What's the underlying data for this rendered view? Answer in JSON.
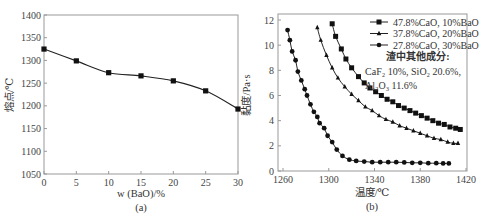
{
  "chart_data": [
    {
      "id": "a",
      "type": "line",
      "title": "",
      "caption": "(a)",
      "xlabel": "w (BaO)/%",
      "ylabel": "熔点/℃",
      "xlim": [
        0,
        30
      ],
      "ylim": [
        1050,
        1400
      ],
      "xticks": [
        0,
        5,
        10,
        15,
        20,
        25,
        30
      ],
      "yticks": [
        1050,
        1100,
        1150,
        1200,
        1250,
        1300,
        1350,
        1400
      ],
      "grid": false,
      "series": [
        {
          "name": "melting point",
          "marker": "square",
          "x": [
            0,
            5,
            10,
            15,
            20,
            25,
            30
          ],
          "values": [
            1325,
            1299,
            1273,
            1266,
            1255,
            1233,
            1193
          ]
        }
      ]
    },
    {
      "id": "b",
      "type": "line",
      "title": "",
      "caption": "(b)",
      "xlabel": "温度/℃",
      "ylabel": "黏度/Pa·s",
      "xlim": [
        1255,
        1420
      ],
      "ylim": [
        0,
        12.5
      ],
      "xticks": [
        1260,
        1300,
        1340,
        1380,
        1420
      ],
      "yticks": [
        0,
        2,
        4,
        6,
        8,
        10,
        12
      ],
      "grid": false,
      "legend_position": "upper right",
      "annotation": {
        "title": "渣中其他成分:",
        "line1": "CaF₂ 10%, SiO₂ 20.6%,",
        "line2": "Al₂O₃ 11.6%"
      },
      "series": [
        {
          "name": "47.8%CaO, 10%BaO",
          "marker": "square",
          "x": [
            1303,
            1306,
            1311,
            1315,
            1320,
            1326,
            1331,
            1336,
            1341,
            1346,
            1351,
            1356,
            1361,
            1366,
            1371,
            1376,
            1381,
            1386,
            1391,
            1396,
            1401,
            1406,
            1411,
            1415
          ],
          "values": [
            11.7,
            10.7,
            9.7,
            8.9,
            8.2,
            7.5,
            7.0,
            6.6,
            6.3,
            6.0,
            5.7,
            5.5,
            5.2,
            5.0,
            4.8,
            4.6,
            4.4,
            4.2,
            4.0,
            3.8,
            3.7,
            3.5,
            3.4,
            3.3
          ]
        },
        {
          "name": "37.8%CaO, 20%BaO",
          "marker": "triangle",
          "x": [
            1290,
            1293,
            1298,
            1303,
            1308,
            1314,
            1320,
            1326,
            1332,
            1338,
            1344,
            1350,
            1356,
            1362,
            1368,
            1374,
            1380,
            1386,
            1392,
            1398,
            1404,
            1409,
            1413
          ],
          "values": [
            11.4,
            10.4,
            9.2,
            8.2,
            7.4,
            6.7,
            6.1,
            5.6,
            5.1,
            4.8,
            4.4,
            4.1,
            3.9,
            3.6,
            3.4,
            3.2,
            3.0,
            2.8,
            2.6,
            2.5,
            2.3,
            2.2,
            2.2
          ]
        },
        {
          "name": "27.8%CaO, 30%BaO",
          "marker": "circle",
          "x": [
            1264,
            1266,
            1268,
            1271,
            1273,
            1276,
            1279,
            1281,
            1284,
            1287,
            1290,
            1292,
            1296,
            1299,
            1303,
            1307,
            1312,
            1318,
            1324,
            1331,
            1338,
            1345,
            1352,
            1359,
            1366,
            1373,
            1380,
            1387,
            1394,
            1400,
            1405
          ],
          "values": [
            11.2,
            10.4,
            9.5,
            8.8,
            7.9,
            7.2,
            6.5,
            6.0,
            5.3,
            4.7,
            4.3,
            3.8,
            3.4,
            2.8,
            2.3,
            1.7,
            1.2,
            0.9,
            0.8,
            0.75,
            0.7,
            0.7,
            0.7,
            0.7,
            0.68,
            0.65,
            0.65,
            0.62,
            0.62,
            0.6,
            0.6
          ]
        }
      ]
    }
  ]
}
